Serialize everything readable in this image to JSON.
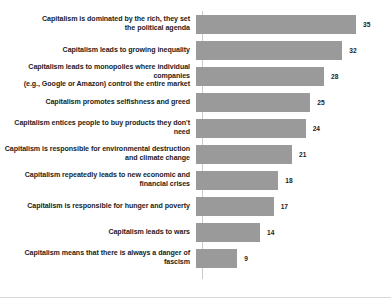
{
  "chart_data": {
    "type": "bar",
    "orientation": "horizontal",
    "title": "",
    "subtitle": "",
    "xlabel": "",
    "ylabel": "",
    "grid": false,
    "legend": null,
    "axis_range": [
      0,
      35
    ],
    "value_suffix": "",
    "bar_color": "#9a9a9a",
    "axis_line_color": "#c9c9c9",
    "text_color": "#1c1c1c",
    "categories": [
      "Capitalism is dominated by the rich, they set\nthe political agenda",
      "Capitalism leads to growing inequality",
      "Capitalism leads to monopolies where individual companies\n(e.g., Google or Amazon) control the entire market",
      "Capitalism promotes selfishness and greed",
      "Capitalism entices people to buy products they don't need",
      "Capitalism is responsible for environmental destruction\nand climate change",
      "Capitalism repeatedly leads to new economic and\nfinancial crises",
      "Capitalism is responsible for hunger and poverty",
      "Capitalism leads to wars",
      "Capitalism means that there is always a danger of fascism"
    ],
    "values": [
      35,
      32,
      28,
      25,
      24,
      21,
      18,
      17,
      14,
      9
    ],
    "value_labels": [
      "35",
      "32",
      "28",
      "25",
      "24",
      "21",
      "18",
      "17",
      "14",
      "9"
    ]
  }
}
